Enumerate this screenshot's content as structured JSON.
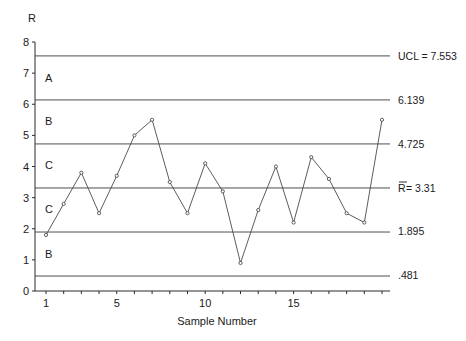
{
  "chart_data": {
    "type": "line",
    "title": "",
    "xlabel": "Sample Number",
    "ylabel": "R",
    "xlim": [
      1,
      20
    ],
    "ylim": [
      0,
      8
    ],
    "x_ticks": [
      1,
      5,
      10,
      15
    ],
    "y_ticks": [
      0,
      1,
      2,
      3,
      4,
      5,
      6,
      7,
      8
    ],
    "grid": false,
    "legend": null,
    "x": [
      1,
      2,
      3,
      4,
      5,
      6,
      7,
      8,
      9,
      10,
      11,
      12,
      13,
      14,
      15,
      16,
      17,
      18,
      19,
      20
    ],
    "series": [
      {
        "name": "Range",
        "values": [
          1.8,
          2.8,
          3.8,
          2.5,
          3.7,
          5.0,
          5.5,
          3.5,
          2.5,
          4.1,
          3.2,
          0.9,
          2.6,
          4.0,
          2.2,
          4.3,
          3.6,
          2.5,
          2.2,
          5.5
        ]
      }
    ],
    "reference_lines": [
      {
        "value": 7.553,
        "label": "UCL = 7.553"
      },
      {
        "value": 6.139,
        "label": "6.139"
      },
      {
        "value": 4.725,
        "label": "4.725"
      },
      {
        "value": 3.31,
        "label": "R̄ = 3.31"
      },
      {
        "value": 1.895,
        "label": "1.895"
      },
      {
        "value": 0.481,
        "label": ".481"
      }
    ],
    "zones": [
      {
        "label": "A",
        "y": 6.85
      },
      {
        "label": "B",
        "y": 5.45
      },
      {
        "label": "C",
        "y": 4.05
      },
      {
        "label": "C",
        "y": 2.65
      },
      {
        "label": "B",
        "y": 1.2
      }
    ]
  },
  "labels": {
    "y_axis_title": "R",
    "x_axis_title": "Sample Number",
    "ucl": "UCL = 7.553",
    "upper_b": "6.139",
    "upper_c": "4.725",
    "center_symbol": "R",
    "center_value": " = 3.31",
    "lower_c": "1.895",
    "lower_b": ".481"
  }
}
